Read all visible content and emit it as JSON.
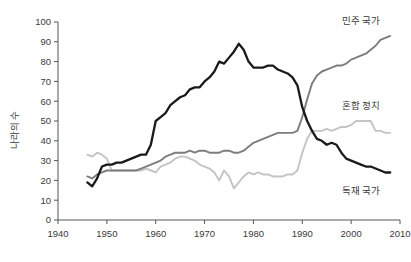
{
  "chart_data": {
    "type": "line",
    "title": "",
    "xlabel": "",
    "ylabel": "나라의 수",
    "xlim": [
      1940,
      2010
    ],
    "ylim": [
      0,
      100
    ],
    "xticks": [
      1940,
      1950,
      1960,
      1970,
      1980,
      1990,
      2000,
      2010
    ],
    "yticks": [
      0,
      10,
      20,
      30,
      40,
      50,
      60,
      70,
      80,
      90,
      100
    ],
    "xtick_labels": [
      "1940",
      "1950",
      "1960",
      "1970",
      "1980",
      "1990",
      "2000",
      "2010"
    ],
    "ytick_labels": [
      "0",
      "10",
      "20",
      "30",
      "40",
      "50",
      "60",
      "70",
      "80",
      "90",
      "100"
    ],
    "grid": false,
    "legend_position": "inline-right-annotations",
    "x": [
      1946,
      1947,
      1948,
      1949,
      1950,
      1951,
      1952,
      1953,
      1954,
      1955,
      1956,
      1957,
      1958,
      1959,
      1960,
      1961,
      1962,
      1963,
      1964,
      1965,
      1966,
      1967,
      1968,
      1969,
      1970,
      1971,
      1972,
      1973,
      1974,
      1975,
      1976,
      1977,
      1978,
      1979,
      1980,
      1981,
      1982,
      1983,
      1984,
      1985,
      1986,
      1987,
      1988,
      1989,
      1990,
      1991,
      1992,
      1993,
      1994,
      1995,
      1996,
      1997,
      1998,
      1999,
      2000,
      2001,
      2002,
      2003,
      2004,
      2005,
      2006,
      2007,
      2008
    ],
    "series": [
      {
        "name": "독재 국가",
        "name_en": "Autocracies",
        "color": "#1a1a1a",
        "values": [
          19,
          17,
          21,
          27,
          28,
          28,
          29,
          29,
          30,
          31,
          32,
          33,
          33,
          38,
          50,
          52,
          54,
          58,
          60,
          62,
          63,
          66,
          67,
          67,
          70,
          72,
          75,
          80,
          79,
          82,
          85,
          89,
          86,
          80,
          77,
          77,
          77,
          78,
          78,
          76,
          75,
          74,
          72,
          68,
          57,
          50,
          45,
          41,
          40,
          38,
          39,
          38,
          34,
          31,
          30,
          29,
          28,
          27,
          27,
          26,
          25,
          24,
          24
        ]
      },
      {
        "name": "민주 국가",
        "name_en": "Democracies",
        "color": "#7d7d7d",
        "values": [
          22,
          21,
          23,
          24,
          25,
          25,
          25,
          25,
          25,
          25,
          25,
          26,
          27,
          28,
          29,
          30,
          32,
          33,
          34,
          34,
          34,
          35,
          34,
          35,
          35,
          34,
          34,
          34,
          35,
          35,
          34,
          34,
          35,
          37,
          39,
          40,
          41,
          42,
          43,
          44,
          44,
          44,
          44,
          45,
          52,
          61,
          69,
          73,
          75,
          76,
          77,
          78,
          78,
          79,
          81,
          82,
          83,
          84,
          86,
          88,
          91,
          92,
          93
        ]
      },
      {
        "name": "혼합 정치",
        "name_en": "Mixed regimes / Anocracies",
        "color": "#c4c4c4",
        "values": [
          33,
          32,
          34,
          33,
          31,
          25,
          25,
          25,
          25,
          25,
          25,
          25,
          26,
          25,
          24,
          27,
          28,
          29,
          31,
          32,
          32,
          31,
          30,
          28,
          27,
          26,
          24,
          20,
          25,
          22,
          16,
          19,
          22,
          24,
          23,
          24,
          23,
          23,
          22,
          22,
          22,
          23,
          23,
          25,
          34,
          41,
          45,
          45,
          45,
          46,
          45,
          46,
          47,
          47,
          48,
          50,
          50,
          50,
          50,
          45,
          45,
          44,
          44
        ]
      }
    ],
    "annotations": [
      {
        "text": "민주 국가",
        "x": 2002,
        "y": 99,
        "series": "민주 국가"
      },
      {
        "text": "혼합 정치",
        "x": 2002,
        "y": 56,
        "series": "혼합 정치"
      },
      {
        "text": "독재 국가",
        "x": 2002,
        "y": 13,
        "series": "독재 국가"
      }
    ]
  },
  "axes": {
    "y_title": "나라의 수"
  }
}
